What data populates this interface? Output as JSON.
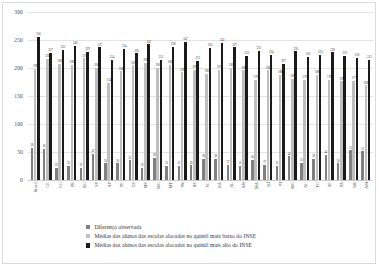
{
  "chart_data": {
    "type": "bar",
    "title": "",
    "xlabel": "",
    "ylabel": "",
    "ylim": [
      0,
      300
    ],
    "yticks": [
      0,
      50,
      100,
      150,
      200,
      250,
      300
    ],
    "grid": true,
    "legend_position": "bottom",
    "categories": [
      "Brasil",
      "CE",
      "GO",
      "PB",
      "RO",
      "SP",
      "AP",
      "PE",
      "ES",
      "MS",
      "MG",
      "MT",
      "PR",
      "RS",
      "SC",
      "BA",
      "AL",
      "RN",
      "MA",
      "RJ",
      "PI",
      "MG",
      "AC",
      "TO",
      "SE",
      "PA",
      "RR",
      "AM"
    ],
    "series": [
      {
        "name": "Diferença observada",
        "color": "#808080",
        "values": [
          58,
          56,
          22,
          25,
          22,
          47,
          30,
          30,
          35,
          22,
          39,
          25,
          25,
          26,
          38,
          38,
          27,
          25,
          36,
          27,
          25,
          42,
          31,
          38,
          45,
          30,
          53,
          51
        ]
      },
      {
        "name": "Médias dos alunos das escolas alocadas no quintil mais baixo do INSE",
        "color": "#bfbfbf",
        "values": [
          198,
          216,
          208,
          206,
          217,
          200,
          174,
          194,
          205,
          209,
          200,
          206,
          192,
          197,
          190,
          197,
          200,
          196,
          179,
          196,
          188,
          181,
          179,
          188,
          179,
          176,
          177,
          169
        ]
      },
      {
        "name": "Médias dos alunos das escolas alocadas no quintil mais alto do INSE",
        "color": "#1a1a1a",
        "values": [
          256,
          227,
          233,
          240,
          229,
          237,
          214,
          234,
          226,
          242,
          215,
          238,
          247,
          213,
          236,
          245,
          237,
          222,
          231,
          224,
          207,
          230,
          220,
          223,
          228,
          222,
          218,
          215
        ]
      }
    ],
    "value_labels": {
      "series0": [
        58,
        56,
        22,
        25,
        22,
        47,
        30,
        30,
        35,
        22,
        39,
        25,
        25,
        26,
        38,
        38,
        27,
        25,
        36,
        27,
        25,
        42,
        31,
        38,
        45,
        30,
        53,
        51
      ],
      "series1": [
        198,
        216,
        208,
        206,
        217,
        200,
        174,
        194,
        205,
        209,
        200,
        206,
        192,
        197,
        190,
        197,
        200,
        196,
        179,
        196,
        188,
        181,
        179,
        188,
        179,
        176,
        177,
        169
      ],
      "series2": [
        256,
        227,
        233,
        240,
        229,
        237,
        214,
        234,
        226,
        242,
        215,
        238,
        247,
        213,
        236,
        245,
        237,
        222,
        231,
        224,
        207,
        230,
        220,
        223,
        228,
        222,
        218,
        215
      ]
    }
  },
  "legend": {
    "items": [
      {
        "label": "Diferença observada",
        "color": "#808080"
      },
      {
        "label": "Médias dos alunos das escolas alocadas no quintil mais baixo do INSE",
        "color": "#bfbfbf"
      },
      {
        "label": "Médias dos alunos das escolas alocadas no quintil mais alto do INSE",
        "color": "#1a1a1a"
      }
    ]
  }
}
